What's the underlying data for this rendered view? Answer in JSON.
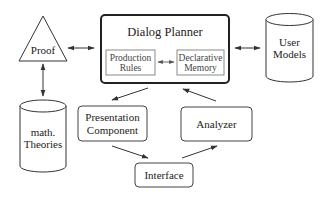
{
  "diagram": {
    "nodes": {
      "proof": {
        "label": "Proof",
        "shape": "triangle"
      },
      "dialog_planner": {
        "label": "Dialog Planner",
        "shape": "rounded-rect-bold",
        "children": {
          "production_rules": {
            "line1": "Production",
            "line2": "Rules"
          },
          "declarative_memory": {
            "line1": "Declarative",
            "line2": "Memory"
          }
        }
      },
      "user_models": {
        "line1": "User",
        "line2": "Models",
        "shape": "cylinder"
      },
      "math_theories": {
        "line1": "math.",
        "line2": "Theories",
        "shape": "cylinder"
      },
      "presentation_component": {
        "line1": "Presentation",
        "line2": "Component",
        "shape": "rounded-rect"
      },
      "analyzer": {
        "label": "Analyzer",
        "shape": "rounded-rect"
      },
      "interface": {
        "label": "Interface",
        "shape": "rounded-rect"
      }
    },
    "edges": [
      {
        "from": "proof",
        "to": "dialog_planner",
        "direction": "both"
      },
      {
        "from": "dialog_planner",
        "to": "user_models",
        "direction": "both"
      },
      {
        "from": "proof",
        "to": "math_theories",
        "direction": "both"
      },
      {
        "from": "production_rules",
        "to": "declarative_memory",
        "direction": "both"
      },
      {
        "from": "dialog_planner",
        "to": "presentation_component",
        "direction": "forward"
      },
      {
        "from": "presentation_component",
        "to": "interface",
        "direction": "forward"
      },
      {
        "from": "interface",
        "to": "analyzer",
        "direction": "forward"
      },
      {
        "from": "analyzer",
        "to": "dialog_planner",
        "direction": "forward"
      }
    ],
    "colors": {
      "stroke": "#333333",
      "inner_stroke": "#8a8a8a",
      "background": "#ffffff"
    }
  }
}
